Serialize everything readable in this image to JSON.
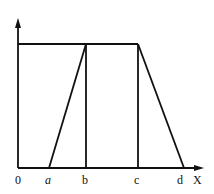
{
  "diagram": {
    "title": "",
    "axis": {
      "x_label": "X",
      "origin_label": "0"
    },
    "ticks": [
      {
        "label": "a",
        "italic": true,
        "x": 49
      },
      {
        "label": "b",
        "italic": false,
        "x": 86
      },
      {
        "label": "c",
        "italic": false,
        "x": 138
      },
      {
        "label": "d",
        "italic": false,
        "x": 184
      }
    ],
    "stroke_color": "#111111"
  }
}
